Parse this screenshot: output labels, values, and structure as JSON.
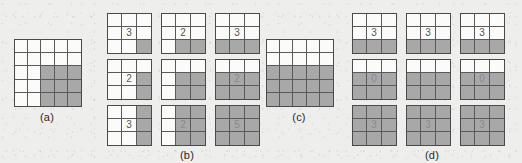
{
  "figure": {
    "background_color": "#eeeeec",
    "shaded_color": "#a8a8a8",
    "empty_color": "#fbfbf9",
    "line_color": "#5a5a5a",
    "number_color": "#555555"
  },
  "panels": [
    {
      "id": "panel-a",
      "label": "(a)",
      "type": "single-grid",
      "grid": {
        "name": "grid-a",
        "rows": 5,
        "cols": 5,
        "shaded": [
          [
            false,
            false,
            false,
            false,
            false
          ],
          [
            false,
            false,
            false,
            false,
            false
          ],
          [
            false,
            false,
            true,
            true,
            true
          ],
          [
            false,
            false,
            true,
            true,
            true
          ],
          [
            false,
            false,
            true,
            true,
            true
          ]
        ],
        "numbers": [
          [
            "",
            "",
            "",
            "",
            ""
          ],
          [
            "",
            "",
            "",
            "",
            ""
          ],
          [
            "",
            "",
            "",
            "",
            ""
          ],
          [
            "",
            "",
            "",
            "",
            ""
          ],
          [
            "",
            "",
            "",
            "",
            ""
          ]
        ]
      }
    },
    {
      "id": "panel-b",
      "label": "(b)",
      "type": "grid-matrix",
      "grids": [
        {
          "name": "grid-b1",
          "rows": 3,
          "cols": 3,
          "shaded": [
            [
              false,
              false,
              false
            ],
            [
              false,
              false,
              false
            ],
            [
              false,
              false,
              true
            ]
          ],
          "numbers": [
            [
              "",
              "",
              ""
            ],
            [
              "",
              "3",
              ""
            ],
            [
              "",
              "",
              ""
            ]
          ]
        },
        {
          "name": "grid-b2",
          "rows": 3,
          "cols": 3,
          "shaded": [
            [
              false,
              false,
              false
            ],
            [
              false,
              false,
              false
            ],
            [
              false,
              true,
              true
            ]
          ],
          "numbers": [
            [
              "",
              "",
              ""
            ],
            [
              "",
              "2",
              ""
            ],
            [
              "",
              "",
              ""
            ]
          ]
        },
        {
          "name": "grid-b3",
          "rows": 3,
          "cols": 3,
          "shaded": [
            [
              false,
              false,
              false
            ],
            [
              false,
              false,
              false
            ],
            [
              true,
              true,
              true
            ]
          ],
          "numbers": [
            [
              "",
              "",
              ""
            ],
            [
              "",
              "3",
              ""
            ],
            [
              "",
              "",
              ""
            ]
          ]
        },
        {
          "name": "grid-b4",
          "rows": 3,
          "cols": 3,
          "shaded": [
            [
              false,
              false,
              false
            ],
            [
              false,
              false,
              true
            ],
            [
              false,
              false,
              true
            ]
          ],
          "numbers": [
            [
              "",
              "",
              ""
            ],
            [
              "",
              "2",
              ""
            ],
            [
              "",
              "",
              ""
            ]
          ]
        },
        {
          "name": "grid-b5",
          "rows": 3,
          "cols": 3,
          "shaded": [
            [
              false,
              false,
              false
            ],
            [
              false,
              true,
              true
            ],
            [
              false,
              true,
              true
            ]
          ],
          "numbers": [
            [
              "",
              "",
              ""
            ],
            [
              "",
              "",
              ""
            ],
            [
              "",
              "",
              ""
            ]
          ]
        },
        {
          "name": "grid-b6",
          "rows": 3,
          "cols": 3,
          "shaded": [
            [
              false,
              false,
              false
            ],
            [
              true,
              true,
              true
            ],
            [
              true,
              true,
              true
            ]
          ],
          "numbers": [
            [
              "",
              "",
              ""
            ],
            [
              "",
              "2",
              ""
            ],
            [
              "",
              "",
              ""
            ]
          ]
        },
        {
          "name": "grid-b7",
          "rows": 3,
          "cols": 3,
          "shaded": [
            [
              false,
              false,
              true
            ],
            [
              false,
              false,
              true
            ],
            [
              false,
              false,
              true
            ]
          ],
          "numbers": [
            [
              "",
              "",
              ""
            ],
            [
              "",
              "3",
              ""
            ],
            [
              "",
              "",
              ""
            ]
          ]
        },
        {
          "name": "grid-b8",
          "rows": 3,
          "cols": 3,
          "shaded": [
            [
              false,
              true,
              true
            ],
            [
              false,
              true,
              true
            ],
            [
              false,
              true,
              true
            ]
          ],
          "numbers": [
            [
              "",
              "",
              ""
            ],
            [
              "",
              "2",
              ""
            ],
            [
              "",
              "",
              ""
            ]
          ]
        },
        {
          "name": "grid-b9",
          "rows": 3,
          "cols": 3,
          "shaded": [
            [
              true,
              true,
              true
            ],
            [
              true,
              true,
              true
            ],
            [
              true,
              true,
              true
            ]
          ],
          "numbers": [
            [
              "",
              "",
              ""
            ],
            [
              "",
              "5",
              ""
            ],
            [
              "",
              "",
              ""
            ]
          ]
        }
      ]
    },
    {
      "id": "panel-c",
      "label": "(c)",
      "type": "single-grid",
      "grid": {
        "name": "grid-c",
        "rows": 5,
        "cols": 5,
        "shaded": [
          [
            false,
            false,
            false,
            false,
            false
          ],
          [
            false,
            false,
            false,
            false,
            false
          ],
          [
            true,
            true,
            true,
            true,
            true
          ],
          [
            true,
            true,
            true,
            true,
            true
          ],
          [
            true,
            true,
            true,
            true,
            true
          ]
        ],
        "numbers": [
          [
            "",
            "",
            "",
            "",
            ""
          ],
          [
            "",
            "",
            "",
            "",
            ""
          ],
          [
            "",
            "",
            "",
            "",
            ""
          ],
          [
            "",
            "",
            "",
            "",
            ""
          ],
          [
            "",
            "",
            "",
            "",
            ""
          ]
        ]
      }
    },
    {
      "id": "panel-d",
      "label": "(d)",
      "type": "grid-matrix",
      "grids": [
        {
          "name": "grid-d1",
          "rows": 3,
          "cols": 3,
          "shaded": [
            [
              false,
              false,
              false
            ],
            [
              false,
              false,
              false
            ],
            [
              true,
              true,
              true
            ]
          ],
          "numbers": [
            [
              "",
              "",
              ""
            ],
            [
              "",
              "3",
              ""
            ],
            [
              "",
              "",
              ""
            ]
          ]
        },
        {
          "name": "grid-d2",
          "rows": 3,
          "cols": 3,
          "shaded": [
            [
              false,
              false,
              false
            ],
            [
              false,
              false,
              false
            ],
            [
              true,
              true,
              true
            ]
          ],
          "numbers": [
            [
              "",
              "",
              ""
            ],
            [
              "",
              "3",
              ""
            ],
            [
              "",
              "",
              ""
            ]
          ]
        },
        {
          "name": "grid-d3",
          "rows": 3,
          "cols": 3,
          "shaded": [
            [
              false,
              false,
              false
            ],
            [
              false,
              false,
              false
            ],
            [
              true,
              true,
              true
            ]
          ],
          "numbers": [
            [
              "",
              "",
              ""
            ],
            [
              "",
              "3",
              ""
            ],
            [
              "",
              "",
              ""
            ]
          ]
        },
        {
          "name": "grid-d4",
          "rows": 3,
          "cols": 3,
          "shaded": [
            [
              false,
              false,
              false
            ],
            [
              true,
              true,
              true
            ],
            [
              true,
              true,
              true
            ]
          ],
          "numbers": [
            [
              "",
              "",
              ""
            ],
            [
              "",
              "0",
              ""
            ],
            [
              "",
              "",
              ""
            ]
          ]
        },
        {
          "name": "grid-d5",
          "rows": 3,
          "cols": 3,
          "shaded": [
            [
              false,
              false,
              false
            ],
            [
              true,
              true,
              true
            ],
            [
              true,
              true,
              true
            ]
          ],
          "numbers": [
            [
              "",
              "",
              ""
            ],
            [
              "",
              "",
              ""
            ],
            [
              "",
              "",
              ""
            ]
          ]
        },
        {
          "name": "grid-d6",
          "rows": 3,
          "cols": 3,
          "shaded": [
            [
              false,
              false,
              false
            ],
            [
              true,
              true,
              true
            ],
            [
              true,
              true,
              true
            ]
          ],
          "numbers": [
            [
              "",
              "",
              ""
            ],
            [
              "",
              "0",
              ""
            ],
            [
              "",
              "",
              ""
            ]
          ]
        },
        {
          "name": "grid-d7",
          "rows": 3,
          "cols": 3,
          "shaded": [
            [
              true,
              true,
              true
            ],
            [
              true,
              true,
              true
            ],
            [
              true,
              true,
              true
            ]
          ],
          "numbers": [
            [
              "",
              "",
              ""
            ],
            [
              "",
              "3",
              ""
            ],
            [
              "",
              "",
              ""
            ]
          ]
        },
        {
          "name": "grid-d8",
          "rows": 3,
          "cols": 3,
          "shaded": [
            [
              true,
              true,
              true
            ],
            [
              true,
              true,
              true
            ],
            [
              true,
              true,
              true
            ]
          ],
          "numbers": [
            [
              "",
              "",
              ""
            ],
            [
              "",
              "3",
              ""
            ],
            [
              "",
              "",
              ""
            ]
          ]
        },
        {
          "name": "grid-d9",
          "rows": 3,
          "cols": 3,
          "shaded": [
            [
              true,
              true,
              true
            ],
            [
              true,
              true,
              true
            ],
            [
              true,
              true,
              true
            ]
          ],
          "numbers": [
            [
              "",
              "",
              ""
            ],
            [
              "",
              "3",
              ""
            ],
            [
              "",
              "",
              ""
            ]
          ]
        }
      ]
    }
  ]
}
